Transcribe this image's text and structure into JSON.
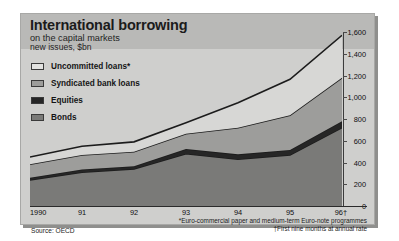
{
  "figure": {
    "title": "International borrowing",
    "subtitle": "on the capital markets",
    "units": "new issues, $bn",
    "source": "Source: OECD",
    "footnotes": [
      "*Euro-commercial paper and medium-term Euro-note programmes",
      "†First nine months at annual rate"
    ]
  },
  "colors": {
    "panel": "#cfcfcd",
    "header_band": "#b9b9b7",
    "uncommitted": "#d7d7d5",
    "syndicated": "#9d9d9b",
    "equities": "#262626",
    "bonds": "#7a7a78",
    "axis": "#2b2b2b"
  },
  "legend": {
    "position": "top-left",
    "items": [
      {
        "label": "Uncommitted loans*",
        "color": "#e2e2e0",
        "key": "uncommitted"
      },
      {
        "label": "Syndicated bank loans",
        "color": "#9d9d9b",
        "key": "syndicated"
      },
      {
        "label": "Equities",
        "color": "#262626",
        "key": "equities"
      },
      {
        "label": "Bonds",
        "color": "#7a7a78",
        "key": "bonds"
      }
    ]
  },
  "chart_data": {
    "type": "area",
    "title": "International borrowing",
    "subtitle": "on the capital markets",
    "xlabel": "",
    "ylabel": "new issues, $bn",
    "ylim": [
      0,
      1600
    ],
    "yticks": [
      0,
      200,
      400,
      600,
      800,
      1000,
      1200,
      1400,
      1600
    ],
    "ytick_labels": [
      "0",
      "200",
      "400",
      "600",
      "800",
      "1,000",
      "1,200",
      "1,400",
      "1,600"
    ],
    "grid": false,
    "stacked": true,
    "categories": [
      "1990",
      "91",
      "92",
      "93",
      "94",
      "95",
      "96†"
    ],
    "x": [
      1990,
      1991,
      1992,
      1993,
      1994,
      1995,
      1996
    ],
    "xtick_labels": [
      "1990",
      "91",
      "92",
      "93",
      "94",
      "95",
      "96†"
    ],
    "series": [
      {
        "name": "Bonds",
        "color": "#7a7a78",
        "values": [
          240,
          310,
          340,
          480,
          430,
          470,
          720
        ]
      },
      {
        "name": "Equities",
        "color": "#262626",
        "values": [
          20,
          25,
          25,
          45,
          45,
          45,
          60
        ]
      },
      {
        "name": "Syndicated bank loans",
        "color": "#9d9d9b",
        "values": [
          125,
          135,
          135,
          140,
          245,
          320,
          400
        ]
      },
      {
        "name": "Uncommitted loans*",
        "color": "#d7d7d5",
        "values": [
          65,
          80,
          90,
          100,
          230,
          330,
          390
        ]
      }
    ],
    "totals": [
      450,
      550,
      590,
      765,
      950,
      1165,
      1570
    ]
  }
}
